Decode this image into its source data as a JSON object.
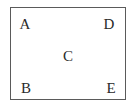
{
  "diagram": {
    "border_color": "#5a5a5a",
    "labels": [
      {
        "id": "A",
        "text": "A",
        "x": 25,
        "y": 24
      },
      {
        "id": "D",
        "text": "D",
        "x": 109,
        "y": 24
      },
      {
        "id": "C",
        "text": "C",
        "x": 68,
        "y": 56
      },
      {
        "id": "B",
        "text": "B",
        "x": 26,
        "y": 88
      },
      {
        "id": "E",
        "text": "E",
        "x": 111,
        "y": 88
      }
    ]
  }
}
